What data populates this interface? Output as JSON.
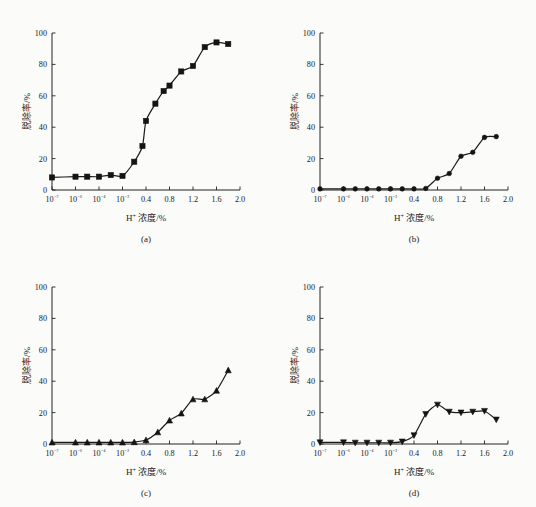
{
  "figure": {
    "background_color": "#fbfbf9",
    "ink_color": "#141414",
    "panel_count": 4
  },
  "chart_data": [
    {
      "type": "line",
      "panel": "a",
      "caption": "(a)",
      "title": "",
      "xlabel": "H⁺ 浓度/%",
      "ylabel": "脱除率/%",
      "marker": "square",
      "grid": false,
      "legend": "none",
      "ylim": [
        0,
        100
      ],
      "yticks": [
        0,
        20,
        40,
        60,
        80,
        100
      ],
      "ytick_labels": [
        "0",
        "20",
        "40",
        "60",
        "80",
        "100"
      ],
      "xtick_labels": [
        "10⁻⁷",
        "10⁻⁶",
        "10⁻⁴",
        "10⁻²",
        "0.4",
        "0.8",
        "1.2",
        "1.6",
        "2.0"
      ],
      "xtick_slots": [
        0,
        1,
        2,
        3,
        4,
        5,
        6,
        7,
        8
      ],
      "x": [
        "10-7",
        "10-6",
        "10-5",
        "10-4",
        "10-3",
        "10-2",
        "0.2",
        "0.3",
        "0.4",
        "0.5",
        "0.6",
        "0.8",
        "1.0",
        "1.2",
        "1.4",
        "1.6",
        "1.8"
      ],
      "x_slots": [
        0,
        1,
        1.5,
        2,
        2.5,
        3,
        3.5,
        3.85,
        4,
        4.4,
        4.75,
        5,
        5.5,
        6,
        6.5,
        7,
        7.5
      ],
      "values": [
        8,
        8.5,
        8.5,
        8.5,
        9.5,
        9,
        18,
        28,
        44,
        55,
        63,
        66.5,
        75.5,
        79,
        91,
        94,
        93
      ]
    },
    {
      "type": "line",
      "panel": "b",
      "caption": "(b)",
      "title": "",
      "xlabel": "H⁺ 浓度/%",
      "ylabel": "脱除率/%",
      "marker": "circle",
      "grid": false,
      "legend": "none",
      "ylim": [
        0,
        100
      ],
      "yticks": [
        0,
        20,
        40,
        60,
        80,
        100
      ],
      "ytick_labels": [
        "0",
        "20",
        "40",
        "60",
        "80",
        "100"
      ],
      "xtick_labels": [
        "10⁻⁷",
        "10⁻⁶",
        "10⁻⁴",
        "10⁻²",
        "0.4",
        "0.8",
        "1.2",
        "1.6",
        "2.0"
      ],
      "xtick_slots": [
        0,
        1,
        2,
        3,
        4,
        5,
        6,
        7,
        8
      ],
      "x": [
        "10-7",
        "10-6",
        "10-5",
        "10-4",
        "10-3",
        "10-2",
        "0.2",
        "0.4",
        "0.6",
        "0.8",
        "1.0",
        "1.2",
        "1.4",
        "1.6",
        "1.8"
      ],
      "x_slots": [
        0,
        1,
        1.5,
        2,
        2.5,
        3,
        3.5,
        4,
        4.5,
        5,
        5.5,
        6,
        6.5,
        7,
        7.5
      ],
      "values": [
        0.7,
        0.7,
        0.7,
        0.7,
        0.7,
        0.7,
        0.7,
        0.7,
        1.0,
        7.5,
        10.5,
        21.5,
        24,
        33.5,
        34
      ]
    },
    {
      "type": "line",
      "panel": "c",
      "caption": "(c)",
      "title": "",
      "xlabel": "H⁺ 浓度/%",
      "ylabel": "脱除率/%",
      "marker": "triangle-up",
      "grid": false,
      "legend": "none",
      "ylim": [
        0,
        100
      ],
      "yticks": [
        0,
        20,
        40,
        60,
        80,
        100
      ],
      "ytick_labels": [
        "0",
        "20",
        "40",
        "60",
        "80",
        "100"
      ],
      "xtick_labels": [
        "10⁻⁷",
        "10⁻⁶",
        "10⁻⁴",
        "10⁻²",
        "0.4",
        "0.8",
        "1.2",
        "1.6",
        "2.0"
      ],
      "xtick_slots": [
        0,
        1,
        2,
        3,
        4,
        5,
        6,
        7,
        8
      ],
      "x": [
        "10-7",
        "10-6",
        "10-5",
        "10-4",
        "10-3",
        "10-2",
        "0.2",
        "0.4",
        "0.6",
        "0.8",
        "1.0",
        "1.2",
        "1.4",
        "1.6",
        "1.8"
      ],
      "x_slots": [
        0,
        1,
        1.5,
        2,
        2.5,
        3,
        3.5,
        4,
        4.5,
        5,
        5.5,
        6,
        6.5,
        7,
        7.5
      ],
      "values": [
        1,
        1,
        1,
        1,
        1,
        1,
        1.2,
        2.5,
        7.5,
        15,
        19.5,
        28.5,
        28.5,
        34,
        47
      ]
    },
    {
      "type": "line",
      "panel": "d",
      "caption": "(d)",
      "title": "",
      "xlabel": "H⁺ 浓度/%",
      "ylabel": "脱除率/%",
      "marker": "triangle-down",
      "grid": false,
      "legend": "none",
      "ylim": [
        0,
        100
      ],
      "yticks": [
        0,
        20,
        40,
        60,
        80,
        100
      ],
      "ytick_labels": [
        "0",
        "20",
        "40",
        "60",
        "80",
        "100"
      ],
      "xtick_labels": [
        "10⁻⁷",
        "10⁻⁶",
        "10⁻⁴",
        "10⁻²",
        "0.4",
        "0.8",
        "1.2",
        "1.6",
        "2.0"
      ],
      "xtick_slots": [
        0,
        1,
        2,
        3,
        4,
        5,
        6,
        7,
        8
      ],
      "x": [
        "10-7",
        "10-6",
        "10-5",
        "10-4",
        "10-3",
        "10-2",
        "0.2",
        "0.4",
        "0.6",
        "0.8",
        "1.0",
        "1.2",
        "1.4",
        "1.6",
        "1.8"
      ],
      "x_slots": [
        0,
        1,
        1.5,
        2,
        2.5,
        3,
        3.5,
        4,
        4.5,
        5,
        5.5,
        6,
        6.5,
        7,
        7.5
      ],
      "values": [
        1,
        1,
        0.8,
        0.8,
        0.8,
        0.8,
        1.5,
        5.5,
        19,
        25,
        20.5,
        20,
        20.5,
        21,
        15.5
      ]
    }
  ]
}
